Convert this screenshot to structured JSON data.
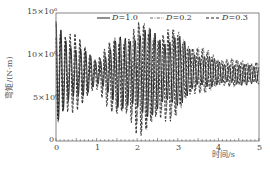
{
  "chart_data": {
    "type": "line",
    "title": "",
    "xlabel": "时间/s",
    "ylabel": "弯矩/(N·m)",
    "xlim": [
      0,
      5
    ],
    "ylim": [
      0,
      15000000
    ],
    "x_ticks": [
      "0",
      "1",
      "2",
      "3",
      "4",
      "5"
    ],
    "y_ticks": [
      "0",
      "5×10⁶",
      "10×10⁶",
      "15×10⁶"
    ],
    "grid": false,
    "legend_position": "top-right, inside",
    "series": [
      {
        "name": "D=1.0",
        "style": "solid",
        "x": [
          0,
          0.5,
          1,
          1.5,
          2,
          2.5,
          3,
          3.5,
          4,
          4.5,
          5
        ],
        "peak_values": [
          14000000,
          11500000,
          9500000,
          12000000,
          13500000,
          13000000,
          12500000,
          10500000,
          9500000,
          9000000,
          9000000
        ],
        "trough_values": [
          2000000,
          4500000,
          6500000,
          4000000,
          2500000,
          3000000,
          4000000,
          6000000,
          6500000,
          6500000,
          6500000
        ]
      },
      {
        "name": "D=0.2",
        "style": "dash-dot",
        "x": [
          0,
          0.5,
          1,
          1.5,
          2,
          2.5,
          3,
          3.5,
          4,
          4.5,
          5
        ],
        "peak_values": [
          14500000,
          12000000,
          10000000,
          12500000,
          14000000,
          13500000,
          13000000,
          11500000,
          10000000,
          9500000,
          9500000
        ],
        "trough_values": [
          1000000,
          4000000,
          6000000,
          3000000,
          1000000,
          1500000,
          3000000,
          5500000,
          6000000,
          6500000,
          6500000
        ]
      },
      {
        "name": "D=0.3",
        "style": "dashed",
        "x": [
          0,
          0.5,
          1,
          1.5,
          2,
          2.5,
          3,
          3.5,
          4,
          4.5,
          5
        ],
        "peak_values": [
          15000000,
          12500000,
          10000000,
          12500000,
          14000000,
          13500000,
          13000000,
          11000000,
          10000000,
          9500000,
          9500000
        ],
        "trough_values": [
          500000,
          3500000,
          5500000,
          2500000,
          500000,
          1000000,
          3000000,
          5500000,
          6000000,
          6500000,
          6500000
        ]
      }
    ]
  },
  "legend": {
    "items": [
      {
        "symbol": "D",
        "value": "=1.0"
      },
      {
        "symbol": "D",
        "value": "=0.2"
      },
      {
        "symbol": "D",
        "value": "=0.3"
      }
    ]
  },
  "axes": {
    "xlabel": "时间/s",
    "ylabel": "弯矩/(N·m)",
    "x_ticks": [
      "0",
      "1",
      "2",
      "3",
      "4",
      "5"
    ],
    "y_ticks": [
      "0",
      "5×10⁶",
      "10×10⁶",
      "15×10⁶"
    ]
  }
}
